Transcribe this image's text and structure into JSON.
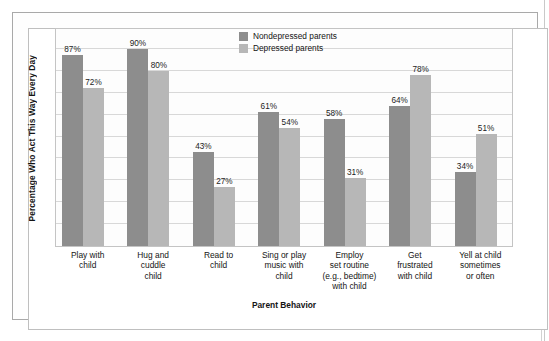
{
  "figure": {
    "y_axis_title": "Percentage Who Act This Way Every Day",
    "x_axis_title": "Parent Behavior"
  },
  "legend": {
    "entries": [
      {
        "label": "Nondepressed parents",
        "color": "#8d8d8d"
      },
      {
        "label": "Depressed parents",
        "color": "#b7b7b7"
      }
    ]
  },
  "chart_data": {
    "type": "bar",
    "title": "",
    "subtitle": "",
    "xlabel": "Parent Behavior",
    "ylabel": "Percentage Who Act This Way Every Day",
    "ylim": [
      0,
      100
    ],
    "ytick_labels": [],
    "grid": true,
    "legend_position": "top-center-right",
    "categories": [
      "Play with child",
      "Hug and cuddle child",
      "Read to child",
      "Sing or play music with child",
      "Employ set routine (e.g., bedtime) with child",
      "Get frustrated with child",
      "Yell at child sometimes or often"
    ],
    "category_label_lines": [
      [
        "Play with",
        "child"
      ],
      [
        "Hug and",
        "cuddle",
        "child"
      ],
      [
        "Read to",
        "child"
      ],
      [
        "Sing or play",
        "music with",
        "child"
      ],
      [
        "Employ",
        "set routine",
        "(e.g., bedtime)",
        "with child"
      ],
      [
        "Get",
        "frustrated",
        "with child"
      ],
      [
        "Yell at child",
        "sometimes",
        "or often"
      ]
    ],
    "series": [
      {
        "name": "Nondepressed parents",
        "color": "#8d8d8d",
        "values": [
          87,
          90,
          43,
          61,
          58,
          64,
          34
        ],
        "value_labels": [
          "87%",
          "90%",
          "43%",
          "61%",
          "58%",
          "64%",
          "34%"
        ]
      },
      {
        "name": "Depressed parents",
        "color": "#b7b7b7",
        "values": [
          72,
          80,
          27,
          54,
          31,
          78,
          51
        ],
        "value_labels": [
          "72%",
          "80%",
          "27%",
          "54%",
          "31%",
          "78%",
          "51%"
        ]
      }
    ]
  }
}
